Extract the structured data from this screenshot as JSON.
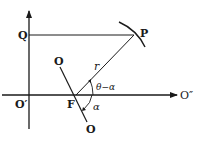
{
  "diagram": {
    "type": "geometry",
    "labels": {
      "Q": "Q",
      "P": "P",
      "O_top": "O",
      "O_bottom": "O",
      "O_prime": "O′",
      "O_double": "O″",
      "F": "F",
      "r": "r",
      "theta_minus_alpha": "θ−α",
      "alpha": "α"
    },
    "colors": {
      "stroke": "#1a1a1a",
      "background": "#ffffff"
    }
  }
}
